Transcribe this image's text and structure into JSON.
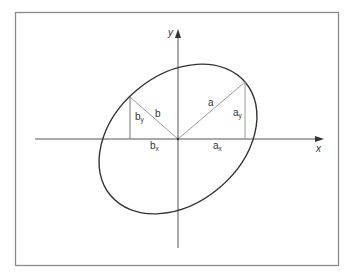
{
  "diagram": {
    "axes": {
      "x_label": "x",
      "y_label": "y"
    },
    "vectors": {
      "a": {
        "label": "a"
      },
      "b": {
        "label": "b"
      }
    },
    "components": {
      "ax": {
        "base": "a",
        "sub": "x"
      },
      "ay": {
        "base": "a",
        "sub": "y"
      },
      "bx": {
        "base": "b",
        "sub": "x"
      },
      "by": {
        "base": "b",
        "sub": "y"
      }
    },
    "colors": {
      "frame": "#8a8a8a",
      "axis": "#555555",
      "ellipse": "#333333",
      "vector": "#9a9a9a"
    }
  }
}
